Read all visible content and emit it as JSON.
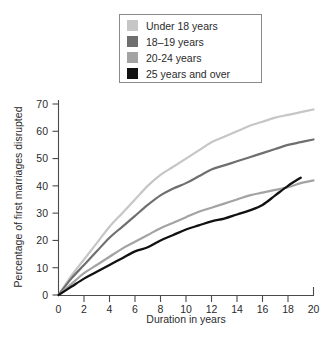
{
  "chart_data": {
    "type": "line",
    "title": "",
    "xlabel": "Duration in years",
    "ylabel": "Percentage of first marriages disrupted",
    "xlim": [
      0,
      20
    ],
    "ylim": [
      0,
      70
    ],
    "xticks": [
      0,
      2,
      4,
      6,
      8,
      10,
      12,
      14,
      16,
      18,
      20
    ],
    "yticks": [
      0,
      10,
      20,
      30,
      40,
      50,
      60,
      70
    ],
    "grid": false,
    "legend_position": "top-center",
    "x": [
      0,
      1,
      2,
      3,
      4,
      5,
      6,
      7,
      8,
      9,
      10,
      11,
      12,
      13,
      14,
      15,
      16,
      17,
      18,
      19,
      20
    ],
    "series": [
      {
        "name": "Under 18 years",
        "color": "#c6c6c6",
        "values": [
          0,
          7,
          13,
          19,
          25,
          30,
          35,
          40,
          44,
          47,
          50,
          53,
          56,
          58,
          60,
          62,
          63.5,
          65,
          66,
          67,
          68
        ]
      },
      {
        "name": "18–19 years",
        "color": "#6f6f6f",
        "values": [
          0,
          6,
          11,
          16,
          21,
          25,
          29,
          33,
          36.5,
          39,
          41,
          43.5,
          46,
          47.5,
          49,
          50.5,
          52,
          53.5,
          55,
          56,
          57
        ]
      },
      {
        "name": "20-24 years",
        "color": "#a3a3a3",
        "values": [
          0,
          4,
          8,
          11,
          14,
          17,
          19.5,
          22,
          24.5,
          26.5,
          28.5,
          30.5,
          32,
          33.5,
          35,
          36.5,
          37.5,
          38.5,
          39.5,
          41,
          42
        ]
      },
      {
        "name": "25 years and over",
        "color": "#111111",
        "values": [
          0,
          3,
          6,
          8.5,
          11,
          13.5,
          16,
          17.5,
          20,
          22,
          24,
          25.5,
          27,
          28,
          29.5,
          31,
          33,
          36.5,
          40,
          43,
          null
        ]
      }
    ]
  },
  "legend": {
    "items": [
      {
        "label": "Under 18 years",
        "swatch": "#c6c6c6"
      },
      {
        "label": "18–19 years",
        "swatch": "#6f6f6f"
      },
      {
        "label": "20-24 years",
        "swatch": "#a3a3a3"
      },
      {
        "label": "25 years and over",
        "swatch": "#111111"
      }
    ]
  },
  "axes": {
    "x_title": "Duration in years",
    "y_title": "Percentage of first marriages disrupted",
    "x_tick_labels": [
      "0",
      "2",
      "4",
      "6",
      "8",
      "10",
      "12",
      "14",
      "16",
      "18",
      "20"
    ],
    "y_tick_labels": [
      "0",
      "10",
      "20",
      "30",
      "40",
      "50",
      "60",
      "70"
    ]
  }
}
